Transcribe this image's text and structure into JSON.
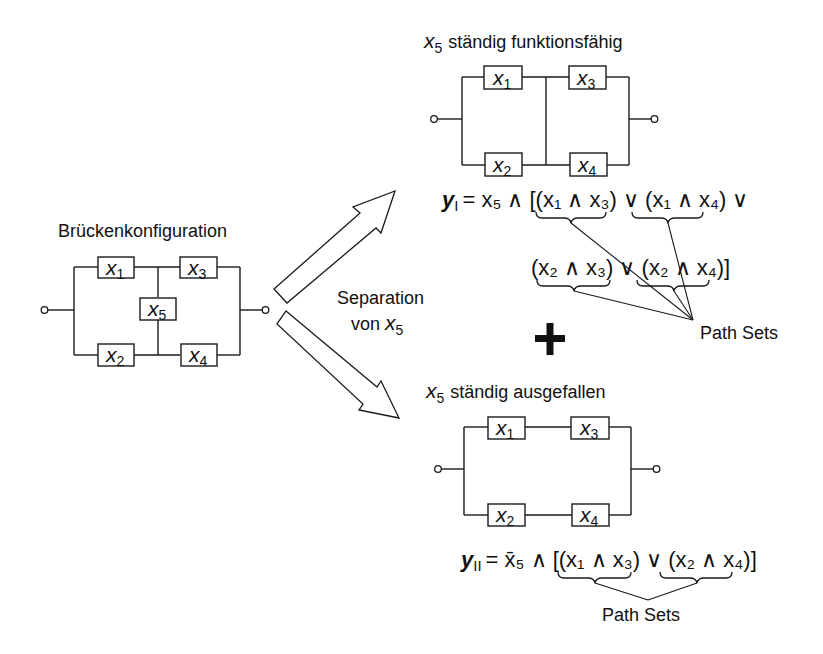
{
  "bridge": {
    "title": "Brückenkonfiguration",
    "components": [
      {
        "var": "x",
        "sub": "1"
      },
      {
        "var": "x",
        "sub": "2"
      },
      {
        "var": "x",
        "sub": "3"
      },
      {
        "var": "x",
        "sub": "4"
      },
      {
        "var": "x",
        "sub": "5"
      }
    ]
  },
  "separation": {
    "line1": "Separation",
    "line2_prefix": "von ",
    "var": "x",
    "sub": "5"
  },
  "case_functional": {
    "title_var": "x",
    "title_sub": "5",
    "title_text": "ständig funktionsfähig",
    "components": [
      {
        "var": "x",
        "sub": "1"
      },
      {
        "var": "x",
        "sub": "2"
      },
      {
        "var": "x",
        "sub": "3"
      },
      {
        "var": "x",
        "sub": "4"
      }
    ],
    "equation": {
      "lhs_var": "y",
      "lhs_sub": "I",
      "line1": "= x₅ ∧ [(x₁ ∧ x₃) ∨ (x₁ ∧ x₄) ∨",
      "line2": "(x₂ ∧ x₃) ∨ (x₂ ∧ x₄)]"
    },
    "annotation": "Path Sets"
  },
  "plus_symbol": "+",
  "case_failed": {
    "title_var": "x",
    "title_sub": "5",
    "title_text": "ständig ausgefallen",
    "components": [
      {
        "var": "x",
        "sub": "1"
      },
      {
        "var": "x",
        "sub": "2"
      },
      {
        "var": "x",
        "sub": "3"
      },
      {
        "var": "x",
        "sub": "4"
      }
    ],
    "equation": {
      "lhs_var": "y",
      "lhs_sub": "II",
      "line1": "= x̄₅ ∧ [(x₁ ∧ x₃) ∨ (x₂ ∧ x₄)]"
    },
    "annotation": "Path Sets"
  },
  "colors": {
    "ink": "#1a1a1a",
    "background": "#ffffff"
  }
}
